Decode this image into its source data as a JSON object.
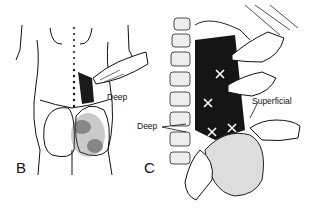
{
  "figure": {
    "panels": [
      {
        "id": "B",
        "letter": "B",
        "subject": "posterior view of lower back and buttocks with palpating hand",
        "labels": {
          "deep": "Deep"
        }
      },
      {
        "id": "C",
        "letter": "C",
        "subject": "close-up of lumbar spine and quadratus lumborum with palpating hands",
        "labels": {
          "deep": "Deep",
          "superficial": "Superficial"
        },
        "markers": [
          "X",
          "X",
          "X",
          "X",
          "X"
        ]
      }
    ],
    "colors": {
      "ink": "#111111",
      "muscle": "#1a1a1a",
      "background": "#ffffff",
      "shading": "#555555"
    }
  }
}
